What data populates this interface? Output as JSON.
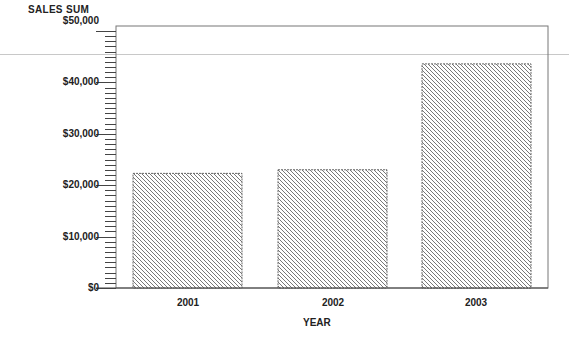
{
  "chart_data": {
    "type": "bar",
    "title": "",
    "xlabel": "YEAR",
    "ylabel": "SALES SUM",
    "categories": [
      "2001",
      "2002",
      "2003"
    ],
    "values": [
      22300,
      23000,
      43600
    ],
    "ylim": [
      0,
      50000
    ],
    "yticks": [
      0,
      10000,
      20000,
      30000,
      40000,
      50000
    ],
    "ytick_labels": [
      "$0",
      "$10,000",
      "$20,000",
      "$30,000",
      "$40,000",
      "$50,000"
    ],
    "minor_tick_step": 1000,
    "grid": false,
    "legend": null,
    "bar_fill": "diagonal-hatch",
    "colors": {
      "hatch": "#555555",
      "frame": "#777777",
      "axis": "#444444"
    }
  },
  "axis": {
    "y_title": "SALES SUM",
    "x_title": "YEAR",
    "y_ticks": [
      "$50,000",
      "$40,000",
      "$30,000",
      "$20,000",
      "$10,000",
      "$0"
    ],
    "x_ticks": [
      "2001",
      "2002",
      "2003"
    ]
  }
}
